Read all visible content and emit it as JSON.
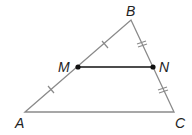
{
  "diagram": {
    "type": "triangle-midsegment",
    "points": {
      "A": {
        "label": "A",
        "x": 25,
        "y": 112
      },
      "B": {
        "label": "B",
        "x": 131,
        "y": 20
      },
      "C": {
        "label": "C",
        "x": 174,
        "y": 112
      },
      "M": {
        "label": "M",
        "x": 78,
        "y": 67
      },
      "N": {
        "label": "N",
        "x": 153,
        "y": 67
      }
    },
    "segments": [
      "AB",
      "BC",
      "CA",
      "MN"
    ],
    "tick_marks": {
      "AM": 1,
      "MB": 1,
      "BN": 2,
      "NC": 2
    },
    "colors": {
      "triangle": "#8a8a8a",
      "midsegment": "#111111",
      "points": "#111111"
    }
  }
}
